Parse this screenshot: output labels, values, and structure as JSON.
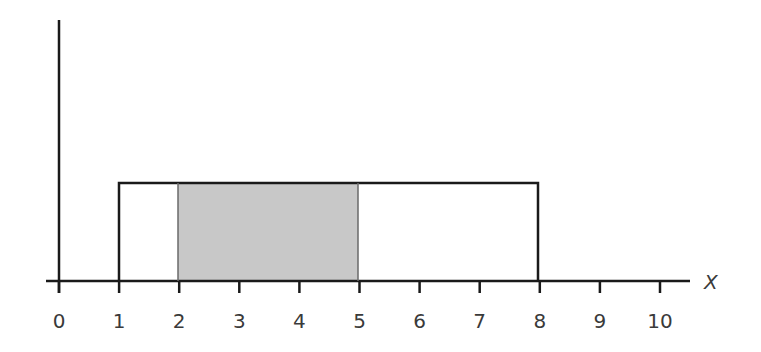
{
  "chart_data": {
    "type": "area",
    "title": "",
    "xlabel": "X",
    "ylabel": "",
    "xlim": [
      0,
      10
    ],
    "x_ticks": [
      0,
      1,
      2,
      3,
      4,
      5,
      6,
      7,
      8,
      9,
      10
    ],
    "tick_labels": [
      "0",
      "1",
      "2",
      "3",
      "4",
      "5",
      "6",
      "7",
      "8",
      "9",
      "10"
    ],
    "distribution": {
      "name": "uniform",
      "a": 1,
      "b": 8,
      "height": 0.142857
    },
    "shaded_region": {
      "from": 2,
      "to": 5
    },
    "grid": false,
    "legend": null,
    "colors": {
      "line": "#1a1a1a",
      "shade": "#c8c8c8",
      "text": "#3a3a3a"
    }
  }
}
